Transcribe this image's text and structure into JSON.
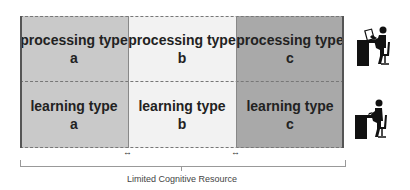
{
  "diagram": {
    "rows": [
      {
        "name": "processing",
        "cells": [
          {
            "line1": "processing type",
            "line2": "a"
          },
          {
            "line1": "processing type",
            "line2": "b"
          },
          {
            "line1": "processing type",
            "line2": "c"
          }
        ]
      },
      {
        "name": "learning",
        "cells": [
          {
            "line1": "learning type",
            "line2": "a"
          },
          {
            "line1": "learning type",
            "line2": "b"
          },
          {
            "line1": "learning type",
            "line2": "c"
          }
        ]
      }
    ],
    "arrow_glyph": "↔",
    "caption": "Limited Cognitive Resource",
    "icons": [
      "person-at-desk-reading-icon",
      "person-at-desk-writing-icon"
    ]
  }
}
